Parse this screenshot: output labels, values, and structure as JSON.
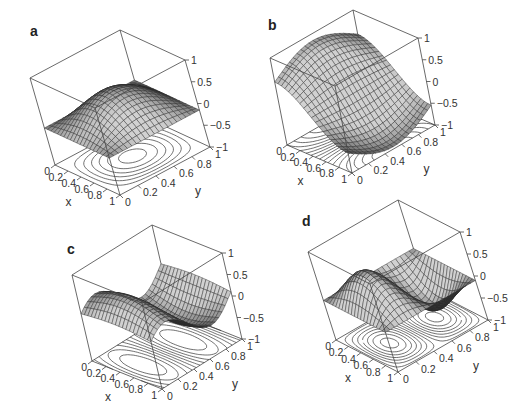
{
  "figure": {
    "panels": [
      {
        "id": "a",
        "label": "a"
      },
      {
        "id": "b",
        "label": "b"
      },
      {
        "id": "c",
        "label": "c"
      },
      {
        "id": "d",
        "label": "d"
      }
    ]
  },
  "chart_data": [
    {
      "type": "surface3d",
      "panel": "a",
      "title": "a",
      "xlabel": "x",
      "ylabel": "y",
      "zlabel": "",
      "xlim": [
        0,
        1
      ],
      "ylim": [
        0,
        1
      ],
      "zlim": [
        -1,
        1
      ],
      "xticks": [
        "0",
        "0.2",
        "0.4",
        "0.6",
        "0.8",
        "1"
      ],
      "yticks": [
        "0",
        "0.2",
        "0.4",
        "0.6",
        "0.8",
        "1"
      ],
      "zticks": [
        "-1",
        "-0.5",
        "0",
        "0.5",
        "1"
      ],
      "surface": "single central peak, z≈0.5 at (0.5,0.5), ~-0.15 at edges",
      "contour_projection": true
    },
    {
      "type": "surface3d",
      "panel": "b",
      "title": "b",
      "xlabel": "x",
      "ylabel": "y",
      "zlabel": "",
      "xlim": [
        0,
        1
      ],
      "ylim": [
        0,
        1
      ],
      "zlim": [
        -1,
        1
      ],
      "xticks": [
        "0",
        "0.2",
        "0.4",
        "0.6",
        "0.8",
        "1"
      ],
      "yticks": [
        "0",
        "0.2",
        "0.4",
        "0.6",
        "0.8",
        "1"
      ],
      "zticks": [
        "-1",
        "-0.5",
        "0",
        "0.5",
        "1"
      ],
      "surface": "ridge near x=0 (z≈0.9), trough near x=1,y=0.4 (z≈-0.9)",
      "contour_projection": true
    },
    {
      "type": "surface3d",
      "panel": "c",
      "title": "c",
      "xlabel": "x",
      "ylabel": "y",
      "zlabel": "",
      "xlim": [
        0,
        1
      ],
      "ylim": [
        0,
        1
      ],
      "zlim": [
        -1,
        1
      ],
      "xticks": [
        "0",
        "0.2",
        "0.4",
        "0.6",
        "0.8",
        "1"
      ],
      "yticks": [
        "0",
        "0.2",
        "0.4",
        "0.6",
        "0.8",
        "1"
      ],
      "zticks": [
        "-1",
        "-0.5",
        "0",
        "0.5",
        "1"
      ],
      "surface": "wave along y: peak near y=0.25, trough near y=0.75, amplitude ~0.5",
      "contour_projection": true
    },
    {
      "type": "surface3d",
      "panel": "d",
      "title": "d",
      "xlabel": "x",
      "ylabel": "y",
      "zlabel": "",
      "xlim": [
        0,
        1
      ],
      "ylim": [
        0,
        1
      ],
      "zlim": [
        -1,
        1
      ],
      "xticks": [
        "0",
        "0.2",
        "0.4",
        "0.6",
        "0.8",
        "1"
      ],
      "yticks": [
        "0",
        "0.2",
        "0.4",
        "0.6",
        "0.8",
        "1"
      ],
      "zticks": [
        "-1",
        "-0.5",
        "0",
        "0.5",
        "1"
      ],
      "surface": "two lobes: peak near y=0.25 (z≈0.5), trough near y=0.75 (z≈-0.6)",
      "contour_projection": true
    }
  ],
  "geometry": [
    {
      "origin": [
        55,
        165
      ],
      "ex": [
        65,
        30
      ],
      "ey": [
        90,
        -48
      ],
      "ez": [
        -25,
        -87
      ],
      "label_pos": [
        30,
        36
      ]
    },
    {
      "origin": [
        287,
        145
      ],
      "ex": [
        65,
        28
      ],
      "ey": [
        83,
        -48
      ],
      "ez": [
        -17,
        -87
      ],
      "label_pos": [
        268,
        30
      ]
    },
    {
      "origin": [
        92,
        361
      ],
      "ex": [
        70,
        28
      ],
      "ey": [
        80,
        -50
      ],
      "ez": [
        -20,
        -86
      ],
      "label_pos": [
        67,
        254
      ]
    },
    {
      "origin": [
        336,
        340
      ],
      "ex": [
        62,
        32
      ],
      "ey": [
        90,
        -52
      ],
      "ez": [
        -28,
        -88
      ],
      "label_pos": [
        302,
        226
      ]
    }
  ]
}
